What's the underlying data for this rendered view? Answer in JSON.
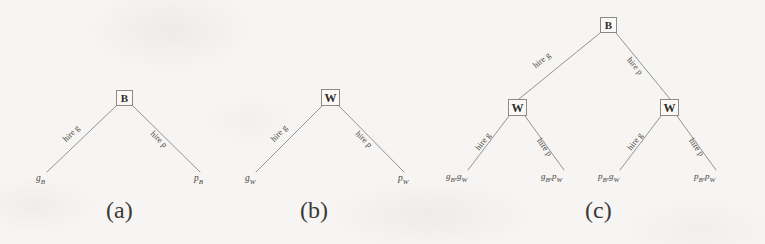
{
  "figure": {
    "background_color": "#f6f5f3",
    "line_color": "#8a8884",
    "text_color": "#46443f",
    "subfigures": [
      {
        "id": "a",
        "caption": "(a)",
        "root": {
          "label": "B"
        },
        "edges": [
          {
            "label": "hire g"
          },
          {
            "label": "hire p"
          }
        ],
        "leaves": [
          {
            "label": "g",
            "sub": "B"
          },
          {
            "label": "p",
            "sub": "B"
          }
        ]
      },
      {
        "id": "b",
        "caption": "(b)",
        "root": {
          "label": "W"
        },
        "edges": [
          {
            "label": "hire g"
          },
          {
            "label": "hire p"
          }
        ],
        "leaves": [
          {
            "label": "g",
            "sub": "W"
          },
          {
            "label": "p",
            "sub": "W"
          }
        ]
      },
      {
        "id": "c",
        "caption": "(c)",
        "root": {
          "label": "B"
        },
        "edges_level1": [
          {
            "label": "hire g"
          },
          {
            "label": "hire p"
          }
        ],
        "internal": [
          {
            "label": "W"
          },
          {
            "label": "W"
          }
        ],
        "edges_level2": [
          {
            "label": "hire g"
          },
          {
            "label": "hire p"
          },
          {
            "label": "hire g"
          },
          {
            "label": "hire p"
          }
        ],
        "leaves": [
          {
            "first": "g",
            "first_sub": "B",
            "sep": ",",
            "second": "g",
            "second_sub": "W"
          },
          {
            "first": "g",
            "first_sub": "B",
            "sep": ",",
            "second": "p",
            "second_sub": "W"
          },
          {
            "first": "p",
            "first_sub": "B",
            "sep": ",",
            "second": "g",
            "second_sub": "W"
          },
          {
            "first": "p",
            "first_sub": "B",
            "sep": ",",
            "second": "p",
            "second_sub": "W"
          }
        ]
      }
    ]
  }
}
